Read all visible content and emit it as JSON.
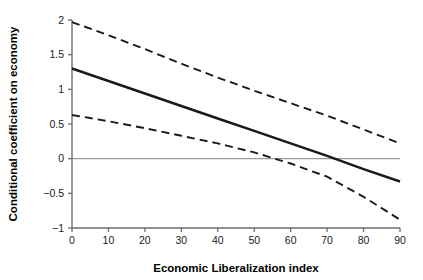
{
  "chart_data": {
    "type": "line",
    "title": "",
    "subtitle": "",
    "xlabel": "Economic Liberalization index",
    "ylabel": "Conditional coefficient on economy",
    "xlim": [
      0,
      90
    ],
    "ylim": [
      -1,
      2
    ],
    "xticks": [
      0,
      10,
      20,
      30,
      40,
      50,
      60,
      70,
      80,
      90
    ],
    "xtick_labels": [
      "0",
      "10",
      "20",
      "30",
      "40",
      "50",
      "60",
      "70",
      "80",
      "90"
    ],
    "yticks": [
      -1,
      -0.5,
      0,
      0.5,
      1,
      1.5,
      2
    ],
    "ytick_labels": [
      "-1",
      "-0.5",
      "0",
      "0.5",
      "1",
      "1.5",
      "2"
    ],
    "grid": false,
    "legend": "none",
    "reference_lines": [
      {
        "name": "zero-line",
        "orientation": "horizontal",
        "value": 0,
        "style": "solid",
        "color": "#9a9a9a"
      }
    ],
    "x": [
      0,
      10,
      20,
      30,
      40,
      50,
      60,
      70,
      80,
      90
    ],
    "series": [
      {
        "name": "Conditional coefficient",
        "role": "estimate",
        "style": "solid",
        "color": "#1a1a1a",
        "values": [
          1.3,
          1.12,
          0.94,
          0.76,
          0.58,
          0.4,
          0.22,
          0.04,
          -0.15,
          -0.33
        ]
      },
      {
        "name": "Upper 95% confidence bound",
        "role": "confidence-upper",
        "style": "dashed",
        "color": "#1a1a1a",
        "values": [
          1.97,
          1.78,
          1.58,
          1.37,
          1.17,
          0.98,
          0.8,
          0.62,
          0.42,
          0.22
        ]
      },
      {
        "name": "Lower 95% confidence bound",
        "role": "confidence-lower",
        "style": "dashed",
        "color": "#1a1a1a",
        "values": [
          0.63,
          0.54,
          0.44,
          0.33,
          0.22,
          0.09,
          -0.07,
          -0.26,
          -0.55,
          -0.88
        ]
      }
    ],
    "annotations": [
      {
        "name": "estimate-zero-crossing",
        "x": 68,
        "y": 0
      },
      {
        "name": "lower-bound-zero-crossing",
        "x": 56,
        "y": 0
      }
    ]
  },
  "geometry": {
    "plot_left_px": 72,
    "plot_right_px": 400,
    "plot_top_px": 20,
    "plot_bottom_px": 228
  }
}
